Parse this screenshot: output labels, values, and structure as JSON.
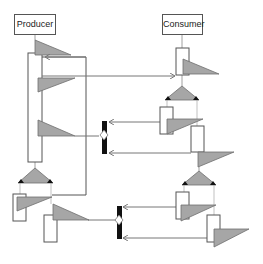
{
  "participants": [
    {
      "id": "producer",
      "label": "Producer"
    },
    {
      "id": "consumer",
      "label": "Consumer"
    }
  ],
  "colors": {
    "stroke": "#555555",
    "triangle_fill": "#a6a6a6",
    "triangle_stroke": "#6e6e6e",
    "bar": "#111111",
    "arrow": "#777777"
  },
  "elements": {
    "fork_blocks": 2,
    "join_junctions": 2,
    "activation_bars": 8,
    "message_triangles": 10
  }
}
